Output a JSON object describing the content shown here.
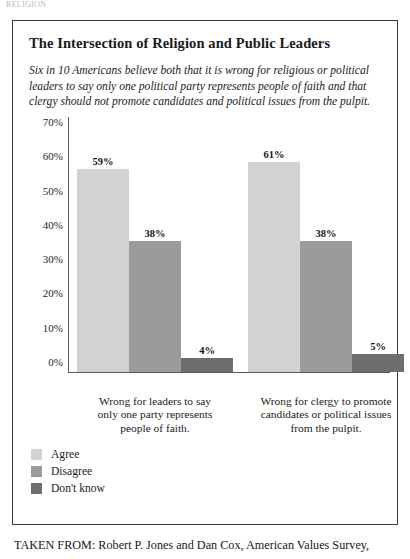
{
  "page": {
    "running_header": "RELIGION"
  },
  "figure": {
    "title": "The Intersection of Religion and Public Leaders",
    "subtitle": "Six in 10 Americans believe both that it is wrong for religious or political leaders to say only one political party represents people of faith and that clergy should not promote candidates and political issues from the pulpit.",
    "source_caption": "TAKEN FROM: Robert P. Jones and Dan Cox, American Values Survey,"
  },
  "colors": {
    "agree": "#d2d2d2",
    "disagree": "#9b9b9b",
    "dont_know": "#6e6e6e",
    "axis": "#5a5a5a",
    "border": "#3a3a3a"
  },
  "chart_data": {
    "type": "bar",
    "title": "The Intersection of Religion and Public Leaders",
    "xlabel": "",
    "ylabel": "",
    "ylim": [
      0,
      70
    ],
    "grid": false,
    "legend_position": "bottom-left",
    "ytick_labels": [
      "70%",
      "60%",
      "50%",
      "40%",
      "30%",
      "20%",
      "10%",
      "0%"
    ],
    "ytick_values": [
      70,
      60,
      50,
      40,
      30,
      20,
      10,
      0
    ],
    "categories": [
      "Wrong for leaders to say only one party represents people of faith.",
      "Wrong for clergy to promote candidates or political issues from the pulpit."
    ],
    "category_lines": [
      [
        "Wrong for leaders to say",
        "only one party represents",
        "people of faith."
      ],
      [
        "Wrong for clergy to promote",
        "candidates or political issues",
        "from the pulpit."
      ]
    ],
    "series": [
      {
        "name": "Agree",
        "color": "#d2d2d2",
        "values": [
          59,
          61
        ],
        "labels": [
          "59%",
          "61%"
        ]
      },
      {
        "name": "Disagree",
        "color": "#9b9b9b",
        "values": [
          38,
          38
        ],
        "labels": [
          "38%",
          "38%"
        ]
      },
      {
        "name": "Don't know",
        "color": "#6e6e6e",
        "values": [
          4,
          5
        ],
        "labels": [
          "4%",
          "5%"
        ]
      }
    ]
  }
}
